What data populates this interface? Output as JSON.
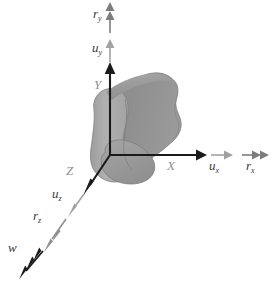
{
  "figure": {
    "type": "3d-axes-vector-diagram",
    "background": "#ffffff",
    "width": 274,
    "height": 283,
    "origin": {
      "x": 110,
      "y": 155
    },
    "axes": [
      {
        "name": "x-axis",
        "label": "X",
        "label_pos": {
          "x": 168,
          "y": 160
        },
        "color": "#1a1a1a",
        "from": {
          "x": 110,
          "y": 155
        },
        "to": {
          "x": 203,
          "y": 155
        }
      },
      {
        "name": "y-axis",
        "label": "Y",
        "label_pos": {
          "x": 95,
          "y": 79
        },
        "color": "#1a1a1a",
        "from": {
          "x": 110,
          "y": 155
        },
        "to": {
          "x": 110,
          "y": 68
        }
      },
      {
        "name": "z-axis",
        "label": "Z",
        "label_pos": {
          "x": 67,
          "y": 165
        },
        "color": "#1a1a1a",
        "from": {
          "x": 110,
          "y": 155
        },
        "to": {
          "x": 85,
          "y": 192
        }
      }
    ],
    "vectors": [
      {
        "name": "u-x",
        "label": "u",
        "subscript": "x",
        "label_pos": {
          "x": 212,
          "y": 162
        },
        "color": "#a2a2a2",
        "heads": 1,
        "from": {
          "x": 211,
          "y": 155
        },
        "to": {
          "x": 232,
          "y": 155
        }
      },
      {
        "name": "r-x",
        "label": "r",
        "subscript": "x",
        "label_pos": {
          "x": 248,
          "y": 162
        },
        "color": "#7d7d7d",
        "heads": 2,
        "from": {
          "x": 242,
          "y": 155
        },
        "to": {
          "x": 270,
          "y": 155
        }
      },
      {
        "name": "u-y",
        "label": "u",
        "subscript": "y",
        "label_pos": {
          "x": 94,
          "y": 43
        },
        "color": "#a2a2a2",
        "heads": 1,
        "from": {
          "x": 110,
          "y": 62
        },
        "to": {
          "x": 110,
          "y": 40
        }
      },
      {
        "name": "r-y",
        "label": "r",
        "subscript": "y",
        "label_pos": {
          "x": 95,
          "y": 8
        },
        "color": "#7d7d7d",
        "heads": 2,
        "from": {
          "x": 110,
          "y": 33
        },
        "to": {
          "x": 110,
          "y": 2
        }
      },
      {
        "name": "u-z",
        "label": "u",
        "subscript": "z",
        "label_pos": {
          "x": 54,
          "y": 190
        },
        "color": "#a2a2a2",
        "heads": 1,
        "from": {
          "x": 82,
          "y": 196
        },
        "to": {
          "x": 68,
          "y": 216
        }
      },
      {
        "name": "r-z",
        "label": "r",
        "subscript": "z",
        "label_pos": {
          "x": 34,
          "y": 211
        },
        "color": "#8f8f8f",
        "heads": 2,
        "from": {
          "x": 65,
          "y": 220
        },
        "to": {
          "x": 44,
          "y": 250
        }
      },
      {
        "name": "w",
        "label": "w",
        "subscript": "",
        "label_pos": {
          "x": 10,
          "y": 243
        },
        "color": "#1a1a1a",
        "heads": 3,
        "from": {
          "x": 42,
          "y": 252
        },
        "to": {
          "x": 15,
          "y": 280
        }
      }
    ],
    "solid": {
      "name": "gray-blob-solid",
      "light_face": "#a6a6a6",
      "dark_face": "#8b8b8b",
      "shadow_face": "#9b9b9b",
      "outline": "#7a7a7a"
    },
    "caption_strip": {
      "visible": true,
      "text": "",
      "y": 275
    }
  }
}
